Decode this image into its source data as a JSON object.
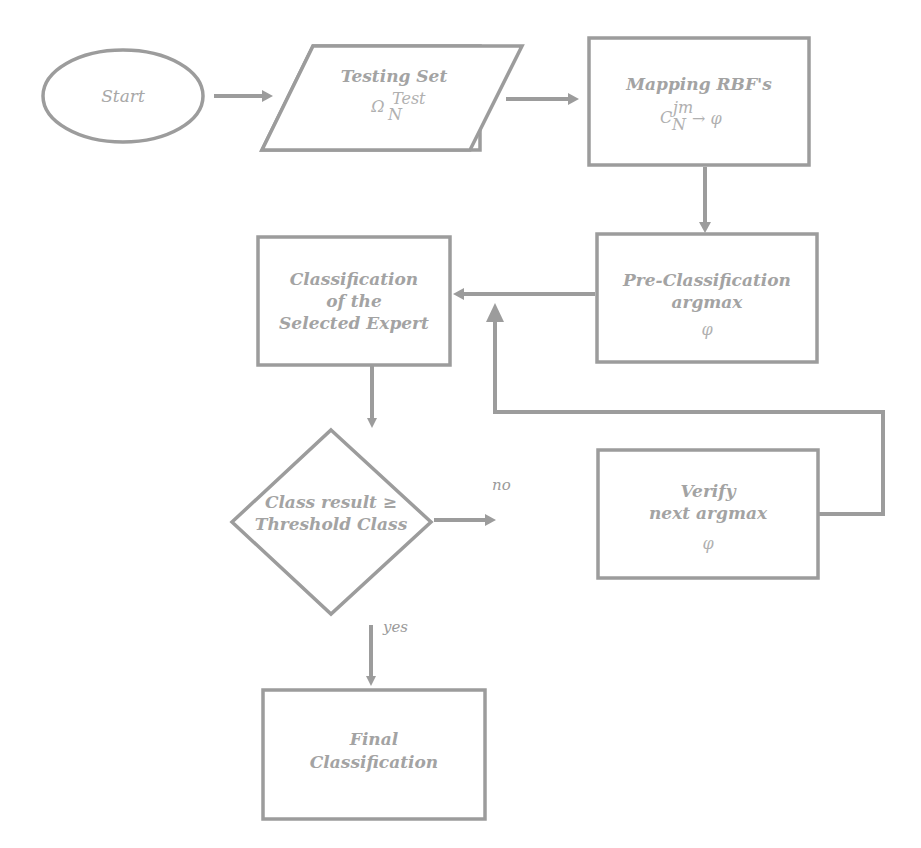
{
  "diagram": {
    "type": "flowchart",
    "colors": {
      "stroke": "#9c9c9c",
      "text": "#a3a3a3",
      "background": "#ffffff"
    },
    "nodes": {
      "start": {
        "shape": "ellipse",
        "label": "Start"
      },
      "testing_set": {
        "shape": "parallelogram",
        "title": "Testing Set",
        "math_base": "Ω",
        "math_sub": "N",
        "math_sup": "Test"
      },
      "mapping_rbf": {
        "shape": "rectangle",
        "title": "Mapping RBF's",
        "math_base": "C",
        "math_sub": "N",
        "math_sup": "jm",
        "math_tail": "→ φ"
      },
      "pre_classification": {
        "shape": "rectangle",
        "line1": "Pre-Classification",
        "line2": "argmax",
        "line3": "φ"
      },
      "classification_expert": {
        "shape": "rectangle",
        "line1": "Classification",
        "line2": "of the",
        "line3": "Selected Expert"
      },
      "decision": {
        "shape": "diamond",
        "line1": "Class result ≥",
        "line2": "Threshold Class"
      },
      "verify": {
        "shape": "rectangle",
        "line1": "Verify",
        "line2": "next argmax",
        "line3": "φ"
      },
      "final": {
        "shape": "rectangle",
        "line1": "Final",
        "line2": "Classification"
      }
    },
    "edges": [
      {
        "from": "start",
        "to": "testing_set",
        "label": ""
      },
      {
        "from": "testing_set",
        "to": "mapping_rbf",
        "label": ""
      },
      {
        "from": "mapping_rbf",
        "to": "pre_classification",
        "label": ""
      },
      {
        "from": "pre_classification",
        "to": "classification_expert",
        "label": ""
      },
      {
        "from": "classification_expert",
        "to": "decision",
        "label": ""
      },
      {
        "from": "decision",
        "to": "verify",
        "label": "no"
      },
      {
        "from": "decision",
        "to": "final",
        "label": "yes"
      },
      {
        "from": "verify",
        "to": "pre_classification_edge",
        "label": ""
      }
    ],
    "edge_labels": {
      "no": "no",
      "yes": "yes"
    }
  }
}
